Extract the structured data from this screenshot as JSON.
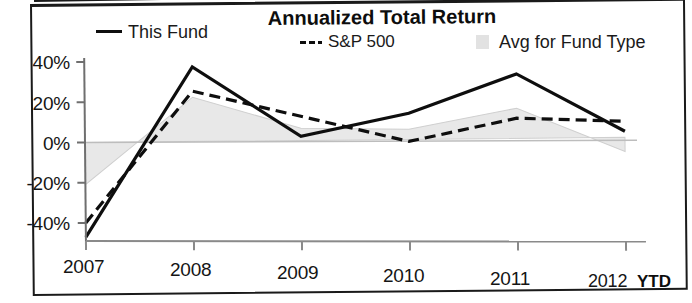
{
  "chart_data": {
    "type": "line",
    "title": "Annualized Total Return",
    "xlabel": "",
    "ylabel": "",
    "categories": [
      "2007",
      "2008",
      "2009",
      "2010",
      "2011",
      "2012"
    ],
    "x_tick_labels": [
      "2007",
      "2008",
      "2009",
      "2010",
      "2011",
      "2012"
    ],
    "x_suffix_label": "YTD",
    "y_tick_labels": [
      "40%",
      "20%",
      "0%",
      "-20%",
      "-40%"
    ],
    "y_tick_values": [
      40,
      20,
      0,
      -20,
      -40
    ],
    "ylim": [
      -50,
      42
    ],
    "grid": false,
    "legend_position": "top",
    "series": [
      {
        "name": "This Fund",
        "style": "solid",
        "color": "#0e0e0e",
        "values": [
          -47,
          37,
          2,
          13,
          32,
          3
        ]
      },
      {
        "name": "S&P 500",
        "style": "dashed",
        "color": "#0e0e0e",
        "values": [
          -40,
          25,
          12,
          -1,
          10,
          8
        ]
      },
      {
        "name": "Avg for Fund Type",
        "style": "area",
        "color": "#e6e6e6",
        "values": [
          -21,
          22,
          6,
          5,
          15,
          -7
        ]
      }
    ]
  },
  "legend": {
    "items": [
      {
        "label": "This Fund",
        "marker": "solid-line-marker"
      },
      {
        "label": "S&P 500",
        "marker": "dashed-line-marker"
      },
      {
        "label": "Avg for Fund Type",
        "marker": "gray-swatch-marker"
      }
    ]
  }
}
